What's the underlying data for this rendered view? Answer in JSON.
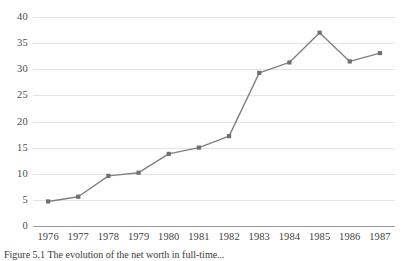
{
  "chart_data": {
    "type": "line",
    "title": "",
    "xlabel": "",
    "ylabel": "",
    "categories": [
      "1976",
      "1977",
      "1978",
      "1979",
      "1980",
      "1981",
      "1982",
      "1983",
      "1984",
      "1985",
      "1986",
      "1987"
    ],
    "values": [
      4.7,
      5.6,
      9.6,
      10.2,
      13.8,
      15.0,
      17.2,
      29.3,
      31.3,
      37.0,
      31.5,
      33.1
    ],
    "series": [
      {
        "name": "",
        "values": [
          4.7,
          5.6,
          9.6,
          10.2,
          13.8,
          15.0,
          17.2,
          29.3,
          31.3,
          37.0,
          31.5,
          33.1
        ]
      }
    ],
    "ylim": [
      0,
      40
    ],
    "yticks": [
      0,
      5,
      10,
      15,
      20,
      25,
      30,
      35,
      40
    ],
    "ytick_labels": [
      "0",
      "5",
      "10",
      "15",
      "20",
      "25",
      "30",
      "35",
      "40"
    ],
    "xtick_labels": [
      "1976",
      "1977",
      "1978",
      "1979",
      "1980",
      "1981",
      "1982",
      "1983",
      "1984",
      "1985",
      "1986",
      "1987"
    ],
    "grid": true,
    "legend": "none",
    "line_color": "#808080",
    "marker_color": "#707070",
    "gridline_color": "#e4e4e4",
    "axis_color": "#9a9a9a"
  },
  "caption": {
    "text": "Figure 5.1 The evolution of the net worth in full-time..."
  }
}
